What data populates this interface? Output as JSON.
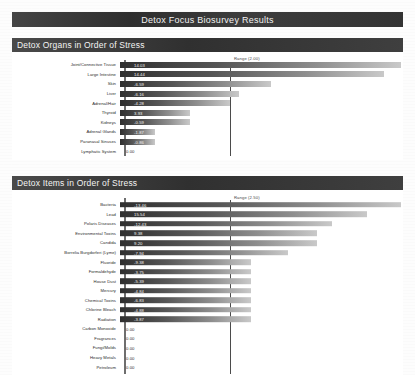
{
  "document": {
    "title": "Detox Focus Biosurvey Results"
  },
  "sections": [
    {
      "id": "detox-organs",
      "header": "Detox Organs in Order of Stress",
      "range_label": "Range (2.00)"
    },
    {
      "id": "detox-items",
      "header": "Detox Items in Order of Stress",
      "range_label": "Range (2.50)"
    }
  ],
  "chart_data": [
    {
      "type": "bar",
      "orientation": "horizontal",
      "title": "Detox Organs in Order of Stress",
      "xlabel": "",
      "ylabel": "",
      "range_marker": 2.0,
      "range_marker_label": "Range (2.00)",
      "categories": [
        "Joint/Connective Tissue",
        "Large Intestine",
        "Skin",
        "Liver",
        "Adrenal/Hair",
        "Thyroid",
        "Kidneys",
        "Adrenal Glands",
        "Paranasal Sinuses",
        "Lymphatic System"
      ],
      "values": [
        14.03,
        14.44,
        -6.59,
        -6.16,
        -4.28,
        3.93,
        -0.59,
        -1.87,
        -0.86,
        0.0
      ],
      "value_labels": [
        "14.03",
        "14.44",
        "-6.59",
        "-6.16",
        "-4.28",
        "3.93",
        "-0.59",
        "-1.87",
        "-0.86",
        "0.00"
      ],
      "bar_lengths_pct": [
        97,
        91,
        52,
        41,
        38,
        24,
        24,
        12,
        12,
        0
      ]
    },
    {
      "type": "bar",
      "orientation": "horizontal",
      "title": "Detox Items in Order of Stress",
      "xlabel": "",
      "ylabel": "",
      "range_marker": 2.5,
      "range_marker_label": "Range (2.50)",
      "categories": [
        "Bacteria",
        "Lead",
        "Polaris Diseases",
        "Environmental Toxins",
        "Candida",
        "Borrelia Burgdorferi (Lyme)",
        "Fluoride",
        "Formaldehyde",
        "House Dust",
        "Mercury",
        "Chemical Toxins",
        "Chlorine Bleach",
        "Radiation",
        "Carbon Monoxide",
        "Fragrances",
        "Fungi/Molds",
        "Heavy Metals",
        "Petroleum"
      ],
      "values": [
        -13.46,
        15.54,
        -12.43,
        9.38,
        9.2,
        -7.94,
        -9.38,
        -3.75,
        -5.39,
        -4.84,
        -6.83,
        -4.88,
        -3.87,
        0.0,
        0.0,
        0.0,
        0.0,
        0.0
      ],
      "value_labels": [
        "-13.46",
        "15.54",
        "-12.43",
        "9.38",
        "9.20",
        "-7.94",
        "-9.38",
        "-3.75",
        "-5.39",
        "-4.84",
        "-6.83",
        "-4.88",
        "-3.87",
        "0.00",
        "0.00",
        "0.00",
        "0.00",
        "0.00"
      ],
      "bar_lengths_pct": [
        97,
        85,
        73,
        68,
        68,
        58,
        45,
        45,
        45,
        45,
        45,
        45,
        45,
        0,
        0,
        0,
        0,
        0
      ]
    }
  ],
  "colors": {
    "header_bar": "#3a3a3a",
    "header_text": "#f2f2f2",
    "bar_dark": "#2f2f2f",
    "bar_light": "#c9c9c9",
    "page_background": "#fdfdfd"
  }
}
